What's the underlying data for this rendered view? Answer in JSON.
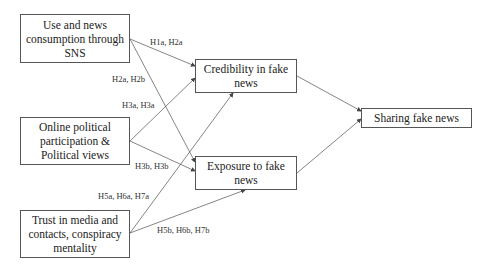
{
  "diagram": {
    "type": "path-model",
    "nodes": [
      {
        "id": "sns",
        "label": "Use and news consumption through SNS"
      },
      {
        "id": "political",
        "label": "Online political participation & Political views"
      },
      {
        "id": "trust",
        "label": "Trust in media and contacts, conspiracy mentality"
      },
      {
        "id": "credibility",
        "label": "Credibility in fake news"
      },
      {
        "id": "exposure",
        "label": "Exposure to fake news"
      },
      {
        "id": "sharing",
        "label": "Sharing fake news"
      }
    ],
    "edges": [
      {
        "from": "sns",
        "to": "credibility",
        "label": "H1a, H2a"
      },
      {
        "from": "sns",
        "to": "exposure",
        "label": "H2a, H2b"
      },
      {
        "from": "political",
        "to": "credibility",
        "label": "H3a, H3a"
      },
      {
        "from": "political",
        "to": "exposure",
        "label": "H3b, H3b"
      },
      {
        "from": "trust",
        "to": "credibility",
        "label": "H5a, H6a, H7a"
      },
      {
        "from": "trust",
        "to": "exposure",
        "label": "H5b, H6b, H7b"
      },
      {
        "from": "credibility",
        "to": "sharing",
        "label": ""
      },
      {
        "from": "exposure",
        "to": "sharing",
        "label": ""
      }
    ]
  },
  "colors": {
    "line": "#555555",
    "text": "#222222",
    "background": "#ffffff"
  }
}
